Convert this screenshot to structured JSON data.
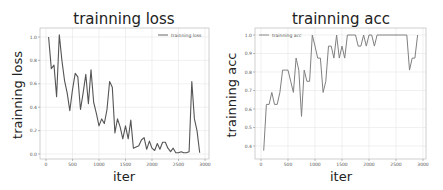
{
  "chart_data": [
    {
      "type": "line",
      "title": "trainning loss",
      "xlabel": "iter",
      "ylabel": "trainning loss",
      "xlim": [
        -100,
        3050
      ],
      "ylim": [
        -0.04,
        1.07
      ],
      "xticks": [
        0,
        500,
        1000,
        1500,
        2000,
        2500,
        3000
      ],
      "yticks": [
        0.0,
        0.2,
        0.4,
        0.6,
        0.8,
        1.0
      ],
      "xtick_labels": [
        "0",
        "500",
        "1000",
        "1500",
        "2000",
        "2500",
        "3000"
      ],
      "ytick_labels": [
        "0.0",
        "0.2",
        "0.4",
        "0.6",
        "0.8",
        "1.0"
      ],
      "grid": true,
      "legend": {
        "position": "upper right",
        "entries": [
          "trainning loss"
        ]
      },
      "series": [
        {
          "name": "trainning loss",
          "color": "#555555",
          "x": [
            50,
            100,
            150,
            200,
            250,
            300,
            350,
            400,
            450,
            500,
            550,
            600,
            650,
            700,
            750,
            800,
            850,
            900,
            950,
            1000,
            1050,
            1100,
            1150,
            1200,
            1250,
            1300,
            1350,
            1400,
            1450,
            1500,
            1550,
            1600,
            1650,
            1700,
            1750,
            1800,
            1850,
            1900,
            1950,
            2000,
            2050,
            2100,
            2150,
            2200,
            2250,
            2300,
            2350,
            2400,
            2450,
            2500,
            2550,
            2600,
            2650,
            2700,
            2750,
            2800,
            2850,
            2900
          ],
          "values": [
            1.0,
            0.73,
            0.76,
            0.49,
            1.02,
            0.8,
            0.63,
            0.52,
            0.37,
            0.55,
            0.69,
            0.66,
            0.38,
            0.52,
            0.68,
            0.43,
            0.72,
            0.44,
            0.35,
            0.24,
            0.3,
            0.26,
            0.38,
            0.62,
            0.57,
            0.18,
            0.3,
            0.23,
            0.13,
            0.24,
            0.13,
            0.29,
            0.05,
            0.06,
            0.07,
            0.12,
            0.14,
            0.04,
            0.11,
            0.05,
            0.03,
            0.09,
            0.04,
            0.1,
            0.1,
            0.05,
            0.02,
            0.05,
            0.01,
            0.01,
            0.02,
            0.01,
            0.01,
            0.02,
            0.62,
            0.3,
            0.2,
            0.01
          ]
        }
      ]
    },
    {
      "type": "line",
      "title": "trainning acc",
      "xlabel": "iter",
      "ylabel": "trainning acc",
      "xlim": [
        -100,
        3050
      ],
      "ylim": [
        0.35,
        1.02
      ],
      "xticks": [
        0,
        500,
        1000,
        1500,
        2000,
        2500,
        3000
      ],
      "yticks": [
        0.4,
        0.5,
        0.6,
        0.7,
        0.8,
        0.9,
        1.0
      ],
      "xtick_labels": [
        "0",
        "500",
        "1000",
        "1500",
        "2000",
        "2500",
        "3000"
      ],
      "ytick_labels": [
        "0.4",
        "0.5",
        "0.6",
        "0.7",
        "0.8",
        "0.9",
        "1.0"
      ],
      "grid": true,
      "legend": {
        "position": "upper left",
        "entries": [
          "trainning acc"
        ]
      },
      "series": [
        {
          "name": "trainning acc",
          "color": "#808080",
          "x": [
            50,
            100,
            150,
            200,
            250,
            300,
            350,
            400,
            450,
            500,
            550,
            600,
            650,
            700,
            750,
            800,
            850,
            900,
            950,
            1000,
            1050,
            1100,
            1150,
            1200,
            1250,
            1300,
            1350,
            1400,
            1450,
            1500,
            1550,
            1600,
            1650,
            1700,
            1750,
            1800,
            1850,
            1900,
            1950,
            2000,
            2050,
            2100,
            2150,
            2200,
            2250,
            2300,
            2350,
            2400,
            2450,
            2500,
            2550,
            2600,
            2650,
            2700,
            2750,
            2800,
            2850,
            2900
          ],
          "values": [
            0.375,
            0.625,
            0.625,
            0.69,
            0.625,
            0.625,
            0.69,
            0.81,
            0.81,
            0.81,
            0.75,
            0.69,
            0.875,
            0.81,
            0.56,
            0.81,
            0.75,
            0.75,
            1.0,
            0.94,
            0.875,
            0.875,
            0.69,
            0.75,
            0.94,
            0.94,
            0.875,
            1.0,
            0.875,
            0.94,
            0.875,
            1.0,
            1.0,
            1.0,
            1.0,
            0.94,
            0.94,
            1.0,
            0.94,
            1.0,
            1.0,
            0.94,
            1.0,
            1.0,
            1.0,
            1.0,
            1.0,
            1.0,
            1.0,
            1.0,
            1.0,
            1.0,
            1.0,
            1.0,
            0.81,
            0.875,
            0.875,
            1.0
          ]
        }
      ]
    }
  ]
}
